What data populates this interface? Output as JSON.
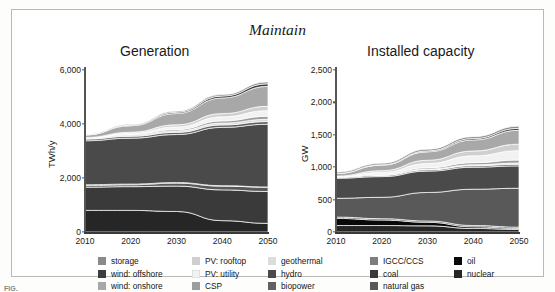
{
  "figure": {
    "supertitle": "Maintain",
    "top_partial_text": "",
    "caption_partial": "FIG."
  },
  "palette": {
    "storage": "#8a8a8a",
    "wind_offshore": "#3d3d3d",
    "wind_onshore": "#a8a8a8",
    "pv_rooftop": "#cfcfcf",
    "pv_utility": "#f2f2f2",
    "csp": "#9d9d9d",
    "geothermal": "#dcdcdc",
    "hydro": "#4a4a4a",
    "biopower": "#616161",
    "igcc_ccs": "#7d7d7d",
    "coal": "#3a3a3a",
    "natural_gas": "#595959",
    "oil": "#090909",
    "nuclear": "#262626",
    "axis": "#555555",
    "frame": "#b9b9b9"
  },
  "legend": {
    "columns": [
      {
        "items": [
          {
            "label": "storage",
            "color": "#8a8a8a"
          },
          {
            "label": "wind: offshore",
            "color": "#3d3d3d"
          },
          {
            "label": "wind: onshore",
            "color": "#a8a8a8"
          }
        ]
      },
      {
        "items": [
          {
            "label": "PV: rooftop",
            "color": "#cfcfcf"
          },
          {
            "label": "PV: utility",
            "color": "#f2f2f2"
          },
          {
            "label": "CSP",
            "color": "#9d9d9d"
          }
        ]
      },
      {
        "items": [
          {
            "label": "geothermal",
            "color": "#dcdcdc"
          },
          {
            "label": "hydro",
            "color": "#4a4a4a"
          },
          {
            "label": "biopower",
            "color": "#616161"
          }
        ]
      },
      {
        "items": [
          {
            "label": "IGCC/CCS",
            "color": "#7d7d7d"
          },
          {
            "label": "coal",
            "color": "#3a3a3a"
          },
          {
            "label": "natural gas",
            "color": "#595959"
          }
        ]
      },
      {
        "items": [
          {
            "label": "oil",
            "color": "#090909"
          },
          {
            "label": "nuclear",
            "color": "#262626"
          }
        ]
      }
    ]
  },
  "chart_data": [
    {
      "type": "area",
      "id": "generation",
      "title": "Generation",
      "xlabel": "",
      "ylabel": "TWh/y",
      "x": [
        2010,
        2020,
        2030,
        2040,
        2050
      ],
      "xticks": [
        "2010",
        "2020",
        "2030",
        "2040",
        "2050"
      ],
      "xlim": [
        2010,
        2050
      ],
      "yticks": [
        "0",
        "2,000",
        "4,000",
        "6,000"
      ],
      "ytickvals": [
        0,
        2000,
        4000,
        6000
      ],
      "ylim": [
        0,
        6000
      ],
      "grid": false,
      "legend_position": "below",
      "stack_order_bottom_to_top": [
        "nuclear",
        "coal",
        "natural gas",
        "IGCC/CCS",
        "oil",
        "hydro",
        "biopower",
        "geothermal",
        "CSP",
        "PV: utility",
        "PV: rooftop",
        "wind: onshore",
        "wind: offshore",
        "storage"
      ],
      "series": [
        {
          "name": "nuclear",
          "color": "#262626",
          "values": [
            800,
            800,
            760,
            420,
            320
          ]
        },
        {
          "name": "coal",
          "color": "#3a3a3a",
          "values": [
            860,
            880,
            940,
            1140,
            1180
          ]
        },
        {
          "name": "natural gas",
          "color": "#595959",
          "values": [
            60,
            70,
            110,
            140,
            160
          ]
        },
        {
          "name": "IGCC/CCS",
          "color": "#7d7d7d",
          "values": [
            0,
            0,
            0,
            0,
            0
          ]
        },
        {
          "name": "oil",
          "color": "#090909",
          "values": [
            30,
            25,
            20,
            15,
            10
          ]
        },
        {
          "name": "hydro",
          "color": "#4a4a4a",
          "values": [
            1630,
            1700,
            1780,
            2160,
            2320
          ]
        },
        {
          "name": "biopower",
          "color": "#616161",
          "values": [
            60,
            70,
            80,
            90,
            100
          ]
        },
        {
          "name": "geothermal",
          "color": "#dcdcdc",
          "values": [
            30,
            40,
            55,
            70,
            85
          ]
        },
        {
          "name": "CSP",
          "color": "#9d9d9d",
          "values": [
            10,
            25,
            50,
            80,
            110
          ]
        },
        {
          "name": "PV: utility",
          "color": "#f2f2f2",
          "values": [
            10,
            45,
            95,
            150,
            210
          ]
        },
        {
          "name": "PV: rooftop",
          "color": "#cfcfcf",
          "values": [
            10,
            40,
            80,
            120,
            160
          ]
        },
        {
          "name": "wind: onshore",
          "color": "#a8a8a8",
          "values": [
            95,
            240,
            420,
            580,
            740
          ]
        },
        {
          "name": "wind: offshore",
          "color": "#3d3d3d",
          "values": [
            0,
            20,
            45,
            70,
            95
          ]
        },
        {
          "name": "storage",
          "color": "#8a8a8a",
          "values": [
            15,
            25,
            40,
            55,
            70
          ]
        }
      ],
      "totals": [
        3610,
        3980,
        4475,
        5090,
        5560
      ]
    },
    {
      "type": "area",
      "id": "installed_capacity",
      "title": "Installed capacity",
      "xlabel": "",
      "ylabel": "GW",
      "x": [
        2010,
        2020,
        2030,
        2040,
        2050
      ],
      "xticks": [
        "2010",
        "2020",
        "2030",
        "2040",
        "2050"
      ],
      "xlim": [
        2010,
        2050
      ],
      "yticks": [
        "0",
        "500",
        "1,000",
        "1,500",
        "2,000",
        "2,500"
      ],
      "ytickvals": [
        0,
        500,
        1000,
        1500,
        2000,
        2500
      ],
      "ylim": [
        0,
        2500
      ],
      "grid": false,
      "legend_position": "below",
      "stack_order_bottom_to_top": [
        "nuclear",
        "oil",
        "coal",
        "natural gas",
        "IGCC/CCS",
        "hydro",
        "biopower",
        "geothermal",
        "CSP",
        "PV: utility",
        "PV: rooftop",
        "wind: onshore",
        "wind: offshore",
        "storage"
      ],
      "series": [
        {
          "name": "nuclear",
          "color": "#262626",
          "values": [
            100,
            100,
            95,
            55,
            40
          ]
        },
        {
          "name": "oil",
          "color": "#090909",
          "values": [
            110,
            85,
            55,
            25,
            15
          ]
        },
        {
          "name": "coal",
          "color": "#3a3a3a",
          "values": [
            20,
            20,
            20,
            20,
            20
          ]
        },
        {
          "name": "natural gas",
          "color": "#595959",
          "values": [
            290,
            330,
            440,
            560,
            600
          ]
        },
        {
          "name": "IGCC/CCS",
          "color": "#7d7d7d",
          "values": [
            0,
            0,
            0,
            0,
            0
          ]
        },
        {
          "name": "hydro",
          "color": "#4a4a4a",
          "values": [
            310,
            320,
            330,
            340,
            345
          ]
        },
        {
          "name": "biopower",
          "color": "#616161",
          "values": [
            15,
            18,
            20,
            22,
            25
          ]
        },
        {
          "name": "geothermal",
          "color": "#dcdcdc",
          "values": [
            5,
            8,
            12,
            16,
            20
          ]
        },
        {
          "name": "CSP",
          "color": "#9d9d9d",
          "values": [
            3,
            10,
            20,
            32,
            45
          ]
        },
        {
          "name": "PV: utility",
          "color": "#f2f2f2",
          "values": [
            5,
            30,
            65,
            105,
            145
          ]
        },
        {
          "name": "PV: rooftop",
          "color": "#cfcfcf",
          "values": [
            5,
            25,
            50,
            75,
            100
          ]
        },
        {
          "name": "wind: onshore",
          "color": "#a8a8a8",
          "values": [
            40,
            85,
            130,
            170,
            215
          ]
        },
        {
          "name": "wind: offshore",
          "color": "#3d3d3d",
          "values": [
            0,
            6,
            14,
            22,
            30
          ]
        },
        {
          "name": "storage",
          "color": "#8a8a8a",
          "values": [
            20,
            23,
            26,
            29,
            32
          ]
        }
      ],
      "totals": [
        923,
        1060,
        1177,
        1271,
        1362
      ]
    }
  ]
}
